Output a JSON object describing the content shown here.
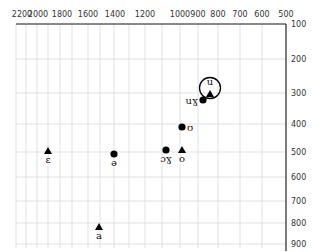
{
  "chart_data": {
    "type": "scatter",
    "title": "",
    "xlabel": "",
    "ylabel": "",
    "x_axis": {
      "position": "top",
      "reversed": true,
      "scale": "bark-like",
      "ticks": [
        2200,
        2000,
        1800,
        1600,
        1400,
        1200,
        1000,
        900,
        800,
        700,
        600,
        500
      ],
      "tick_px": [
        22,
        38,
        62,
        88,
        115,
        145,
        180,
        198,
        218,
        240,
        262,
        286
      ],
      "gridlines_px": [
        16,
        26,
        37,
        48,
        60,
        72,
        88,
        100,
        114,
        129,
        145,
        162,
        180,
        198,
        218,
        240,
        262
      ]
    },
    "y_axis": {
      "position": "right",
      "reversed": true,
      "scale": "bark-like",
      "ticks": [
        100,
        200,
        300,
        400,
        500,
        600,
        700,
        800,
        900
      ],
      "tick_px": [
        24,
        59,
        93,
        124,
        152,
        177,
        201,
        223,
        244
      ]
    },
    "grid": true,
    "legend": null,
    "markers": {
      "triangle": "filled triangle",
      "circle": "filled circle"
    },
    "series": [
      {
        "label": "u",
        "marker": "triangle",
        "x": 850,
        "y": 300,
        "px": [
          210,
          94
        ],
        "label_pos": "above",
        "circled": true
      },
      {
        "label": "uɣ",
        "marker": "circle",
        "x": 880,
        "y": 320,
        "px": [
          203,
          100
        ],
        "label_pos": "left"
      },
      {
        "label": "ʊ",
        "marker": "circle",
        "x": 990,
        "y": 410,
        "px": [
          182,
          127
        ],
        "label_pos": "right"
      },
      {
        "label": "ɔɣ",
        "marker": "circle",
        "x": 1080,
        "y": 495,
        "px": [
          166,
          150
        ],
        "label_pos": "below"
      },
      {
        "label": "o",
        "marker": "triangle",
        "x": 990,
        "y": 495,
        "px": [
          182,
          150
        ],
        "label_pos": "below"
      },
      {
        "label": "ə",
        "marker": "circle",
        "x": 1400,
        "y": 510,
        "px": [
          114,
          154
        ],
        "label_pos": "below"
      },
      {
        "label": "ɛ",
        "marker": "triangle",
        "x": 1900,
        "y": 500,
        "px": [
          48,
          151
        ],
        "label_pos": "below"
      },
      {
        "label": "a",
        "marker": "triangle",
        "x": 1500,
        "y": 820,
        "px": [
          99,
          227
        ],
        "label_pos": "below"
      }
    ],
    "colors": {
      "axis": "#222222",
      "grid": "#d9d9d9",
      "marker": "#000000",
      "text": "#333333"
    }
  }
}
